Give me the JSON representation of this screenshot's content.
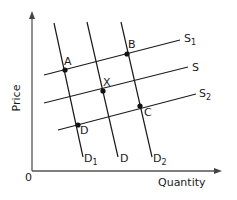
{
  "diagram": {
    "type": "supply-demand",
    "axes": {
      "x_label": "Quantity",
      "y_label": "Price",
      "origin_label": "0"
    },
    "supply_curves": [
      {
        "name": "S",
        "sub": "1",
        "x1": 44,
        "y1": 75,
        "x2": 180,
        "y2": 40
      },
      {
        "name": "S",
        "sub": "",
        "x1": 44,
        "y1": 103,
        "x2": 188,
        "y2": 67
      },
      {
        "name": "S",
        "sub": "2",
        "x1": 58,
        "y1": 130,
        "x2": 196,
        "y2": 94
      }
    ],
    "demand_curves": [
      {
        "name": "D",
        "sub": "1",
        "x1": 54,
        "y1": 23,
        "x2": 83,
        "y2": 157
      },
      {
        "name": "D",
        "sub": "",
        "x1": 87,
        "y1": 22,
        "x2": 118,
        "y2": 157
      },
      {
        "name": "D",
        "sub": "2",
        "x1": 121,
        "y1": 22,
        "x2": 152,
        "y2": 157
      }
    ],
    "points": [
      {
        "label": "A",
        "x": 65,
        "y": 70
      },
      {
        "label": "B",
        "x": 127,
        "y": 54
      },
      {
        "label": "X",
        "x": 103,
        "y": 91
      },
      {
        "label": "D",
        "x": 78,
        "y": 125
      },
      {
        "label": "C",
        "x": 140,
        "y": 106
      }
    ],
    "colors": {
      "line": "#1a1a1a",
      "axis": "#555555"
    }
  }
}
